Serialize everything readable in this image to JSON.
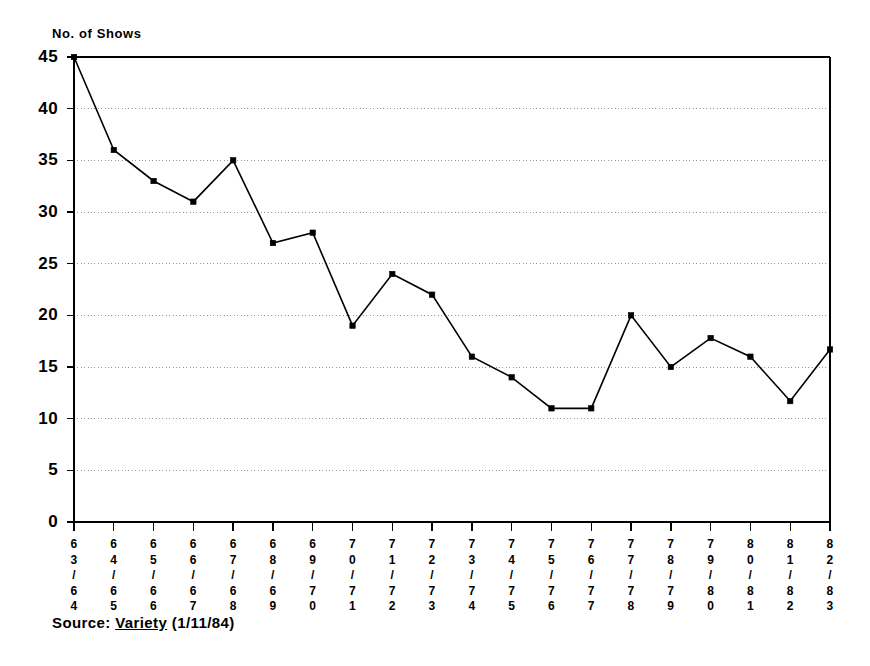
{
  "chart_data": {
    "type": "line",
    "title": "",
    "ylabel": "No. of Shows",
    "xlabel": "",
    "ylim": [
      0,
      45
    ],
    "yticks": [
      0,
      5,
      10,
      15,
      20,
      25,
      30,
      35,
      40,
      45
    ],
    "grid": true,
    "grid_style": "dotted-horizontal",
    "legend": null,
    "marker": "square",
    "line_color": "#000000",
    "categories": [
      "63/64",
      "64/65",
      "65/66",
      "66/67",
      "67/68",
      "68/69",
      "69/70",
      "70/71",
      "71/72",
      "72/73",
      "73/74",
      "74/75",
      "75/76",
      "76/77",
      "77/78",
      "78/79",
      "79/80",
      "80/81",
      "81/82",
      "82/83"
    ],
    "category_chars": [
      [
        "6",
        "3",
        "/",
        "6",
        "4"
      ],
      [
        "6",
        "4",
        "/",
        "6",
        "5"
      ],
      [
        "6",
        "5",
        "/",
        "6",
        "6"
      ],
      [
        "6",
        "6",
        "/",
        "6",
        "7"
      ],
      [
        "6",
        "7",
        "/",
        "6",
        "8"
      ],
      [
        "6",
        "8",
        "/",
        "6",
        "9"
      ],
      [
        "6",
        "9",
        "/",
        "7",
        "0"
      ],
      [
        "7",
        "0",
        "/",
        "7",
        "1"
      ],
      [
        "7",
        "1",
        "/",
        "7",
        "2"
      ],
      [
        "7",
        "2",
        "/",
        "7",
        "3"
      ],
      [
        "7",
        "3",
        "/",
        "7",
        "4"
      ],
      [
        "7",
        "4",
        "/",
        "7",
        "5"
      ],
      [
        "7",
        "5",
        "/",
        "7",
        "6"
      ],
      [
        "7",
        "6",
        "/",
        "7",
        "7"
      ],
      [
        "7",
        "7",
        "/",
        "7",
        "8"
      ],
      [
        "7",
        "8",
        "/",
        "7",
        "9"
      ],
      [
        "7",
        "9",
        "/",
        "8",
        "0"
      ],
      [
        "8",
        "0",
        "/",
        "8",
        "1"
      ],
      [
        "8",
        "1",
        "/",
        "8",
        "2"
      ],
      [
        "8",
        "2",
        "/",
        "8",
        "3"
      ]
    ],
    "values": [
      45,
      36,
      33,
      31,
      35,
      27,
      28,
      19,
      24,
      22,
      16,
      14,
      11,
      11,
      20,
      15,
      17.8,
      16,
      11.7,
      16.7
    ]
  },
  "source": {
    "prefix": "Source: ",
    "publication": "Variety",
    "suffix": " (1/11/84)"
  }
}
